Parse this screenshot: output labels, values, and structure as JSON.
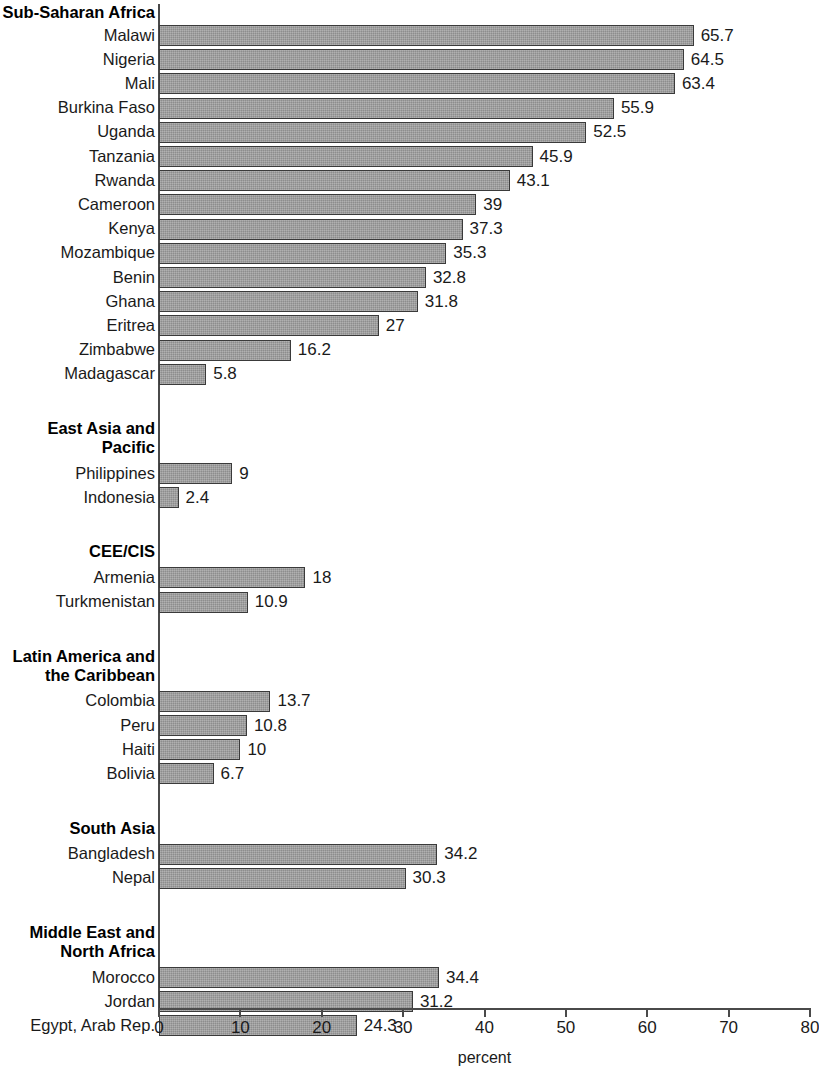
{
  "chart_data": {
    "type": "bar",
    "orientation": "horizontal",
    "title": "",
    "xlabel": "percent",
    "ylabel": "",
    "xlim": [
      0,
      80
    ],
    "xticks": [
      0,
      10,
      20,
      30,
      40,
      50,
      60,
      70,
      80
    ],
    "xtick_labels": [
      "0",
      "10",
      "20",
      "30",
      "40",
      "50",
      "60",
      "70",
      "80"
    ],
    "grid": false,
    "legend": null,
    "bar_color": "#9d9d9d",
    "bar_edge_color": "#3a3a3a",
    "axis_color": "#4a4a4a",
    "groups": [
      {
        "name": "Sub-Saharan Africa",
        "categories": [
          "Malawi",
          "Nigeria",
          "Mali",
          "Burkina Faso",
          "Uganda",
          "Tanzania",
          "Rwanda",
          "Cameroon",
          "Kenya",
          "Mozambique",
          "Benin",
          "Ghana",
          "Eritrea",
          "Zimbabwe",
          "Madagascar"
        ],
        "values": [
          65.7,
          64.5,
          63.4,
          55.9,
          52.5,
          45.9,
          43.1,
          39,
          37.3,
          35.3,
          32.8,
          31.8,
          27,
          16.2,
          5.8
        ],
        "value_labels": [
          "65.7",
          "64.5",
          "63.4",
          "55.9",
          "52.5",
          "45.9",
          "43.1",
          "39",
          "37.3",
          "35.3",
          "32.8",
          "31.8",
          "27",
          "16.2",
          "5.8"
        ]
      },
      {
        "name": "East Asia and\nPacific",
        "categories": [
          "Philippines",
          "Indonesia"
        ],
        "values": [
          9,
          2.4
        ],
        "value_labels": [
          "9",
          "2.4"
        ]
      },
      {
        "name": "CEE/CIS",
        "categories": [
          "Armenia",
          "Turkmenistan"
        ],
        "values": [
          18,
          10.9
        ],
        "value_labels": [
          "18",
          "10.9"
        ]
      },
      {
        "name": "Latin America and\nthe Caribbean",
        "categories": [
          "Colombia",
          "Peru",
          "Haiti",
          "Bolivia"
        ],
        "values": [
          13.7,
          10.8,
          10,
          6.7
        ],
        "value_labels": [
          "13.7",
          "10.8",
          "10",
          "6.7"
        ]
      },
      {
        "name": "South Asia",
        "categories": [
          "Bangladesh",
          "Nepal"
        ],
        "values": [
          34.2,
          30.3
        ],
        "value_labels": [
          "34.2",
          "30.3"
        ]
      },
      {
        "name": "Middle East and\nNorth Africa",
        "categories": [
          "Morocco",
          "Jordan",
          "Egypt, Arab Rep."
        ],
        "values": [
          34.4,
          31.2,
          24.3
        ],
        "value_labels": [
          "34.4",
          "31.2",
          "24.3"
        ]
      }
    ]
  }
}
